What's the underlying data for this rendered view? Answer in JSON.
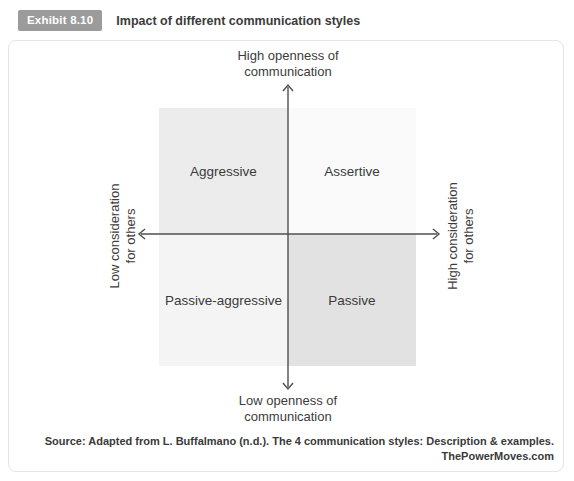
{
  "exhibit": {
    "badge_label": "Exhibit 8.10",
    "title": "Impact of different communication styles"
  },
  "diagram": {
    "type": "quadrant",
    "axis_color": "#4f4f4f",
    "axes": {
      "top": [
        "High openness of",
        "communication"
      ],
      "bottom": [
        "Low openness of",
        "communication"
      ],
      "left": [
        "Low consideration",
        "for others"
      ],
      "right": [
        "High consideration",
        "for others"
      ]
    },
    "quadrants": [
      {
        "position": "top-left",
        "label": "Aggressive",
        "fill": "#ececec"
      },
      {
        "position": "top-right",
        "label": "Assertive",
        "fill": "#fafafa"
      },
      {
        "position": "bottom-left",
        "label": "Passive-aggressive",
        "fill": "#f4f4f4"
      },
      {
        "position": "bottom-right",
        "label": "Passive",
        "fill": "#e2e2e2"
      }
    ]
  },
  "source": {
    "line1": "Source: Adapted from L. Buffalmano (n.d.). The 4 communication styles: Description & examples.",
    "line2": "ThePowerMoves.com"
  },
  "colors": {
    "badge_bg": "#9b9b9b",
    "figure_border": "#e4e4e8",
    "text": "#3d3d3d"
  }
}
